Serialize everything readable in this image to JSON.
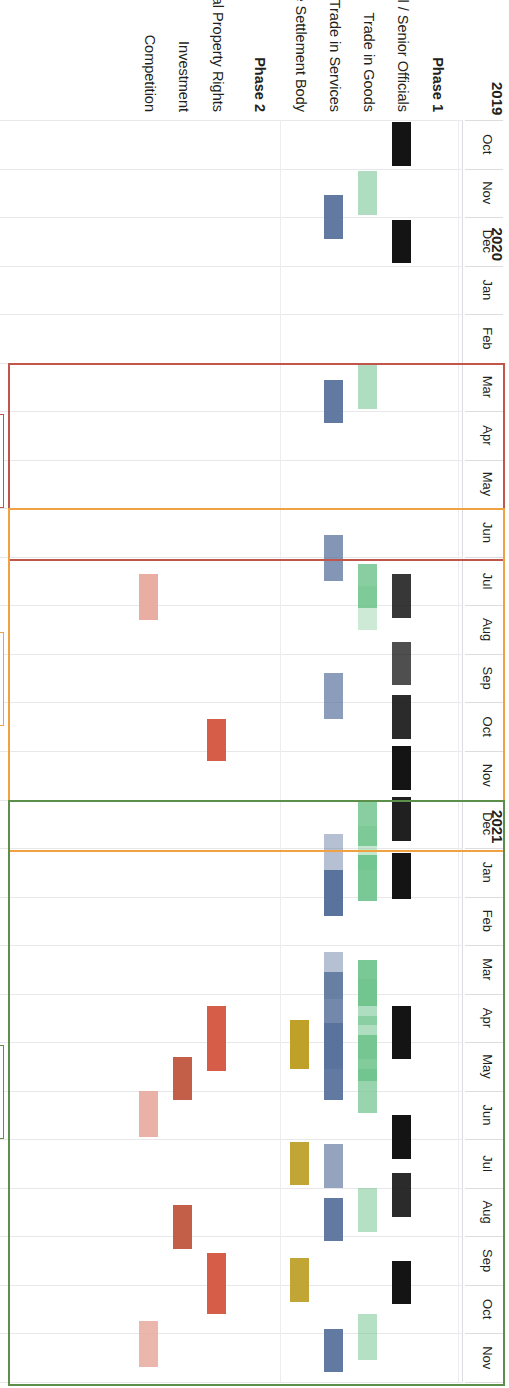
{
  "figure": {
    "orientation": "rotated-90-clockwise",
    "type": "gantt-timeline"
  },
  "axis": {
    "years": [
      {
        "label": "2019",
        "start_month_index": 0,
        "months": 3
      },
      {
        "label": "2020",
        "start_month_index": 3,
        "months": 12
      },
      {
        "label": "2021",
        "start_month_index": 15,
        "months": 11
      }
    ],
    "months": [
      "Oct",
      "Nov",
      "Dec",
      "Jan",
      "Feb",
      "Mar",
      "Apr",
      "May",
      "Jun",
      "Jul",
      "Aug",
      "Sep",
      "Oct",
      "Nov",
      "Dec",
      "Jan",
      "Feb",
      "Mar",
      "Apr",
      "May",
      "Jun",
      "Jul",
      "Aug",
      "Sep",
      "Oct",
      "Nov"
    ]
  },
  "rows": [
    {
      "id": "phase1",
      "label": "Phase 1",
      "bold": true,
      "group_header": true
    },
    {
      "id": "ministerial",
      "label": "Ministerial / Senior Officials",
      "bold": false,
      "group_header": false,
      "color": "#141414"
    },
    {
      "id": "goods",
      "label": "Trade in Goods",
      "bold": false,
      "group_header": false,
      "color": "#6cc28a"
    },
    {
      "id": "services",
      "label": "Trade in Services",
      "bold": false,
      "group_header": false,
      "color": "#5a739c"
    },
    {
      "id": "dsb",
      "label": "Dispute Settlement Body",
      "bold": false,
      "group_header": false,
      "color": "#bfa12a"
    },
    {
      "id": "phase2",
      "label": "Phase 2",
      "bold": true,
      "group_header": true
    },
    {
      "id": "ipr",
      "label": "Intellectual Property Rights",
      "bold": false,
      "group_header": false,
      "color": "#d4553f"
    },
    {
      "id": "investment",
      "label": "Investment",
      "bold": false,
      "group_header": false,
      "color": "#c0553f"
    },
    {
      "id": "competition",
      "label": "Competition",
      "bold": false,
      "group_header": false,
      "color": "#e8a99c"
    }
  ],
  "annotations": [
    {
      "id": "cancelled",
      "label": "Cancelled",
      "color": "#c0564a",
      "start_month_index": 5,
      "end_month_index": 9
    },
    {
      "id": "virtual",
      "label": "Virtual",
      "color": "#f0a142",
      "start_month_index": 8,
      "end_month_index": 15
    },
    {
      "id": "hybrid",
      "label": "Hybrid",
      "color": "#5c8f4a",
      "start_month_index": 14,
      "end_month_index": 26
    }
  ],
  "chart_data": {
    "type": "bar",
    "title": "",
    "xlabel": "",
    "ylabel": "",
    "categories": [
      "Oct 2019",
      "Nov 2019",
      "Dec 2019",
      "Jan 2020",
      "Feb 2020",
      "Mar 2020",
      "Apr 2020",
      "May 2020",
      "Jun 2020",
      "Jul 2020",
      "Aug 2020",
      "Sep 2020",
      "Oct 2020",
      "Nov 2020",
      "Dec 2020",
      "Jan 2021",
      "Feb 2021",
      "Mar 2021",
      "Apr 2021",
      "May 2021",
      "Jun 2021",
      "Jul 2021",
      "Aug 2021",
      "Sep 2021",
      "Oct 2021",
      "Nov 2021"
    ],
    "series": [
      {
        "name": "Ministerial / Senior Officials",
        "color": "#141414",
        "bars": [
          {
            "start": 0.05,
            "end": 0.95,
            "opacity": 1.0
          },
          {
            "start": 2.05,
            "end": 2.95,
            "opacity": 1.0
          },
          {
            "start": 9.35,
            "end": 10.25,
            "opacity": 0.85
          },
          {
            "start": 10.75,
            "end": 11.65,
            "opacity": 0.75
          },
          {
            "start": 11.85,
            "end": 12.75,
            "opacity": 0.9
          },
          {
            "start": 12.9,
            "end": 13.8,
            "opacity": 1.0
          },
          {
            "start": 13.95,
            "end": 14.85,
            "opacity": 0.95
          },
          {
            "start": 15.1,
            "end": 16.05,
            "opacity": 1.0
          },
          {
            "start": 18.25,
            "end": 19.35,
            "opacity": 1.0
          },
          {
            "start": 20.5,
            "end": 21.4,
            "opacity": 1.0
          },
          {
            "start": 21.7,
            "end": 22.6,
            "opacity": 0.9
          },
          {
            "start": 23.5,
            "end": 24.4,
            "opacity": 1.0
          }
        ]
      },
      {
        "name": "Trade in Goods",
        "color": "#6cc28a",
        "bars": [
          {
            "start": 1.05,
            "end": 1.95,
            "opacity": 0.55
          },
          {
            "start": 5.05,
            "end": 5.95,
            "opacity": 0.55
          },
          {
            "start": 9.15,
            "end": 10.05,
            "opacity": 0.8
          },
          {
            "start": 9.6,
            "end": 10.5,
            "opacity": 0.35
          },
          {
            "start": 14.05,
            "end": 14.95,
            "opacity": 0.8
          },
          {
            "start": 14.55,
            "end": 15.45,
            "opacity": 0.4
          },
          {
            "start": 15.15,
            "end": 16.1,
            "opacity": 0.9
          },
          {
            "start": 17.3,
            "end": 18.25,
            "opacity": 0.9
          },
          {
            "start": 17.7,
            "end": 18.65,
            "opacity": 0.55
          },
          {
            "start": 18.45,
            "end": 19.35,
            "opacity": 0.55
          },
          {
            "start": 18.85,
            "end": 19.8,
            "opacity": 0.85
          },
          {
            "start": 19.55,
            "end": 20.45,
            "opacity": 0.7
          },
          {
            "start": 22.0,
            "end": 22.9,
            "opacity": 0.5
          },
          {
            "start": 24.6,
            "end": 25.55,
            "opacity": 0.5
          }
        ]
      },
      {
        "name": "Trade in Services",
        "color": "#5a739c",
        "bars": [
          {
            "start": 1.55,
            "end": 2.45,
            "opacity": 0.95
          },
          {
            "start": 5.35,
            "end": 6.25,
            "opacity": 0.95
          },
          {
            "start": 8.55,
            "end": 9.5,
            "opacity": 0.75
          },
          {
            "start": 11.4,
            "end": 12.35,
            "opacity": 0.7
          },
          {
            "start": 14.7,
            "end": 15.6,
            "opacity": 0.45
          },
          {
            "start": 15.45,
            "end": 16.4,
            "opacity": 1.0
          },
          {
            "start": 17.15,
            "end": 18.1,
            "opacity": 0.45
          },
          {
            "start": 17.55,
            "end": 19.55,
            "opacity": 0.85
          },
          {
            "start": 18.6,
            "end": 19.5,
            "opacity": 1.0
          },
          {
            "start": 19.3,
            "end": 20.2,
            "opacity": 0.95
          },
          {
            "start": 21.1,
            "end": 22.0,
            "opacity": 0.65
          },
          {
            "start": 22.2,
            "end": 23.1,
            "opacity": 0.95
          },
          {
            "start": 24.9,
            "end": 25.8,
            "opacity": 0.95
          }
        ]
      },
      {
        "name": "Dispute Settlement Body",
        "color": "#bfa12a",
        "bars": [
          {
            "start": 18.55,
            "end": 19.55,
            "opacity": 1.0
          },
          {
            "start": 21.05,
            "end": 21.95,
            "opacity": 0.95
          },
          {
            "start": 23.45,
            "end": 24.35,
            "opacity": 0.95
          }
        ]
      },
      {
        "name": "Intellectual Property Rights",
        "color": "#d4553f",
        "bars": [
          {
            "start": 12.35,
            "end": 13.2,
            "opacity": 0.95
          },
          {
            "start": 18.25,
            "end": 19.6,
            "opacity": 0.95
          },
          {
            "start": 23.35,
            "end": 24.6,
            "opacity": 0.95
          }
        ]
      },
      {
        "name": "Investment",
        "color": "#c0553f",
        "bars": [
          {
            "start": 19.3,
            "end": 20.2,
            "opacity": 0.95
          },
          {
            "start": 22.35,
            "end": 23.25,
            "opacity": 0.95
          }
        ]
      },
      {
        "name": "Competition",
        "color": "#e8a99c",
        "bars": [
          {
            "start": 9.35,
            "end": 10.3,
            "opacity": 0.95
          },
          {
            "start": 20.0,
            "end": 20.95,
            "opacity": 0.9
          },
          {
            "start": 24.75,
            "end": 25.7,
            "opacity": 0.85
          }
        ]
      }
    ],
    "annotation_boxes": [
      {
        "label": "Cancelled",
        "color": "#c0564a",
        "from": "Mar 2020",
        "to": "Jun 2020"
      },
      {
        "label": "Virtual",
        "color": "#f0a142",
        "from": "Jun 2020",
        "to": "Dec 2020"
      },
      {
        "label": "Hybrid",
        "color": "#5c8f4a",
        "from": "Dec 2020",
        "to": "Nov 2021"
      }
    ],
    "grid": true,
    "legend": "none"
  }
}
